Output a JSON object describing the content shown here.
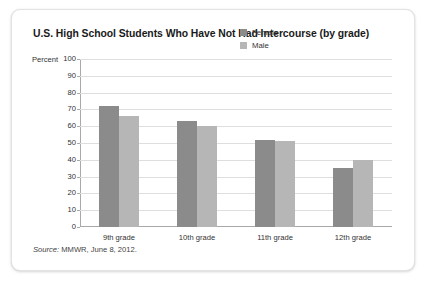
{
  "card": {
    "title": "U.S. High School Students Who Have Not Had Intercourse (by grade)",
    "source_prefix": "Source:",
    "source_text": " MMWR, June 8, 2012."
  },
  "chart_data": {
    "type": "bar",
    "title": "U.S. High School Students Who Have Not Had Intercourse (by grade)",
    "xlabel": "",
    "ylabel": "Percent",
    "ylim": [
      0,
      100
    ],
    "ytick_step": 10,
    "yticks": [
      100,
      90,
      80,
      70,
      60,
      50,
      40,
      30,
      20,
      10,
      0
    ],
    "grid": true,
    "legend_position": "top-right",
    "categories": [
      "9th grade",
      "10th grade",
      "11th grade",
      "12th grade"
    ],
    "series": [
      {
        "name": "Female",
        "color": "#8b8b8b",
        "values": [
          72,
          63,
          52,
          35
        ]
      },
      {
        "name": "Male",
        "color": "#b6b6b6",
        "values": [
          66,
          60,
          51,
          40
        ]
      }
    ],
    "source": "Source: MMWR, June 8, 2012."
  }
}
